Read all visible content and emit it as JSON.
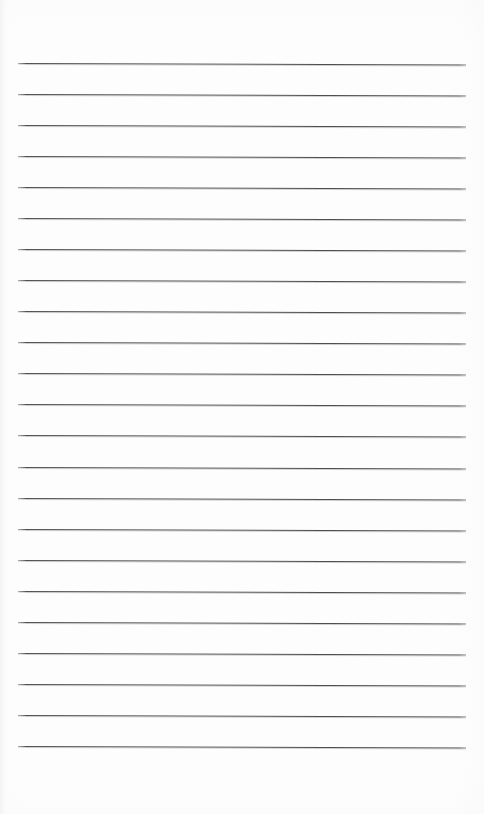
{
  "page": {
    "kind": "lined-paper-sheet",
    "width_px": 484,
    "height_px": 814,
    "background_color": "#fdfdfd",
    "has_text": false,
    "has_margin_rule": false,
    "has_holes": false
  },
  "ruling": {
    "line_count": 23,
    "line_color": "#4d4e50",
    "halo_color": "#96989c",
    "line_thickness_px": 1,
    "spacing_px": 31.05,
    "first_line_y_px": 63,
    "last_line_y_px": 746,
    "left_x_px": 18,
    "right_x_px": 466,
    "line_length_px": 448,
    "slant_deg": 0.18,
    "top_margin_px": 63,
    "bottom_margin_px": 68,
    "left_margin_px": 18,
    "right_margin_px": 18,
    "lines": [
      {
        "index": 1,
        "y": 63
      },
      {
        "index": 2,
        "y": 94
      },
      {
        "index": 3,
        "y": 125
      },
      {
        "index": 4,
        "y": 156
      },
      {
        "index": 5,
        "y": 187
      },
      {
        "index": 6,
        "y": 218
      },
      {
        "index": 7,
        "y": 249
      },
      {
        "index": 8,
        "y": 280
      },
      {
        "index": 9,
        "y": 311
      },
      {
        "index": 10,
        "y": 342
      },
      {
        "index": 11,
        "y": 373
      },
      {
        "index": 12,
        "y": 404
      },
      {
        "index": 13,
        "y": 435
      },
      {
        "index": 14,
        "y": 467
      },
      {
        "index": 15,
        "y": 498
      },
      {
        "index": 16,
        "y": 529
      },
      {
        "index": 17,
        "y": 560
      },
      {
        "index": 18,
        "y": 591
      },
      {
        "index": 19,
        "y": 622
      },
      {
        "index": 20,
        "y": 653
      },
      {
        "index": 21,
        "y": 684
      },
      {
        "index": 22,
        "y": 715
      },
      {
        "index": 23,
        "y": 746
      }
    ]
  }
}
